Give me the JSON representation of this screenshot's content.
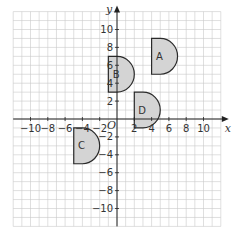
{
  "diagram": {
    "type": "coordinate-plane",
    "grid": {
      "xmin": -12,
      "xmax": 12,
      "ymin": -12,
      "ymax": 12,
      "step": 1
    },
    "axes": {
      "x_label": "x",
      "y_label": "y",
      "origin_label": "O",
      "x_ticks": [
        -10,
        -8,
        -6,
        -4,
        -2,
        2,
        4,
        6,
        8,
        10
      ],
      "y_ticks": [
        -10,
        -8,
        -6,
        -4,
        -2,
        2,
        4,
        6,
        8,
        10
      ]
    },
    "colors": {
      "shape_fill": "#d4d4d4",
      "shape_stroke": "#2a2a2a",
      "grid": "#c9c9c9",
      "axis": "#222222"
    },
    "shapes": [
      {
        "label": "A",
        "left_x": 4,
        "bottom_y": 5,
        "top_y": 9,
        "flat_width": 1,
        "radius": 2
      },
      {
        "label": "B",
        "left_x": -1,
        "bottom_y": 3,
        "top_y": 7,
        "flat_width": 1,
        "radius": 2
      },
      {
        "label": "C",
        "left_x": -5,
        "bottom_y": -5,
        "top_y": -1,
        "flat_width": 1,
        "radius": 2
      },
      {
        "label": "D",
        "left_x": 2,
        "bottom_y": -1,
        "top_y": 3,
        "flat_width": 1,
        "radius": 2
      }
    ]
  }
}
